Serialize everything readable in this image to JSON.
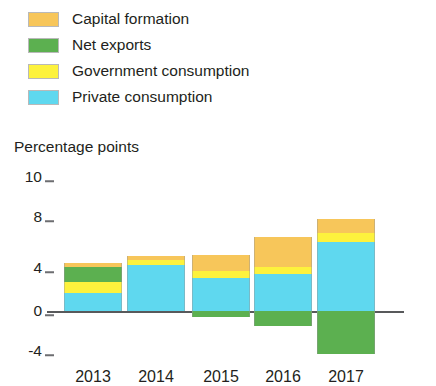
{
  "legend": {
    "items": [
      {
        "label": "Capital formation",
        "key": "capital_formation",
        "color": "#f7c65a"
      },
      {
        "label": "Net exports",
        "key": "net_exports",
        "color": "#5cb050"
      },
      {
        "label": "Government consumption",
        "key": "government_consumption",
        "color": "#fdf23d"
      },
      {
        "label": "Private consumption",
        "key": "private_consumption",
        "color": "#5fd8ef"
      }
    ]
  },
  "axis": {
    "y_title": "Percentage points",
    "y_ticks": [
      "10",
      "8",
      "4",
      "0",
      "-4"
    ],
    "x_ticks": [
      "2013",
      "2014",
      "2015",
      "2016",
      "2017"
    ]
  },
  "chart_data": {
    "type": "bar",
    "stacked": true,
    "title": "",
    "subtitle": "",
    "xlabel": "",
    "ylabel": "Percentage points",
    "ylim": [
      -4,
      10
    ],
    "yticks": [
      -4,
      0,
      4,
      8,
      10
    ],
    "grid": false,
    "legend_position": "top-left",
    "categories": [
      "2013",
      "2014",
      "2015",
      "2016",
      "2017"
    ],
    "series": [
      {
        "name": "Private consumption",
        "color": "#5fd8ef",
        "values": [
          1.6,
          4.2,
          3.0,
          3.4,
          6.3
        ]
      },
      {
        "name": "Government consumption",
        "color": "#fdf23d",
        "values": [
          1.0,
          0.4,
          0.6,
          0.6,
          0.8
        ]
      },
      {
        "name": "Net exports",
        "color": "#5cb050",
        "values": [
          1.4,
          0.0,
          -0.5,
          -1.4,
          -3.9
        ]
      },
      {
        "name": "Capital formation",
        "color": "#f7c65a",
        "values": [
          0.4,
          0.4,
          1.5,
          2.7,
          1.3
        ]
      }
    ],
    "totals": [
      4.4,
      5.0,
      4.6,
      5.3,
      4.5
    ]
  },
  "geometry": {
    "zero_y": 311,
    "px_per_unit": 11.0,
    "bar_width": 58,
    "bar_centers": [
      93,
      156,
      221,
      283,
      346
    ],
    "axis_left": 55,
    "axis_right": 404,
    "tick_y": {
      "10": 177,
      "8": 217,
      "4": 268,
      "0": 311,
      "-4": 351
    },
    "xtick_y": 368
  }
}
